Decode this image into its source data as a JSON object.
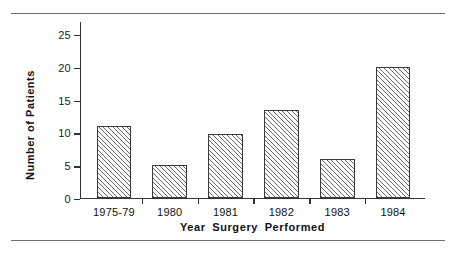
{
  "chart_data": {
    "type": "bar",
    "title": "",
    "xlabel": "Year Surgery Performed",
    "ylabel": "Number of Patients",
    "categories": [
      "1975-79",
      "1980",
      "1981",
      "1982",
      "1983",
      "1984"
    ],
    "values": [
      11,
      5,
      9.7,
      13.5,
      6,
      20
    ],
    "ylim": [
      0,
      27
    ],
    "yticks": [
      0,
      5,
      10,
      15,
      20,
      25
    ],
    "ytick_labels": [
      "0",
      "5",
      "10",
      "15",
      "20",
      "25"
    ],
    "grid": false,
    "legend": null,
    "bar_fill": "hatched-diagonal",
    "bar_edge_color": "#3a3a3a",
    "axis_color": "#333333",
    "background": "#ffffff"
  },
  "figure": {
    "top_rule": "",
    "bottom_rule": ""
  }
}
